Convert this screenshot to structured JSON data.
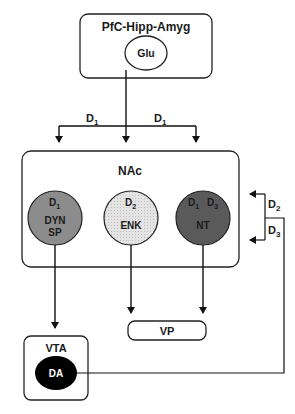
{
  "diagram": {
    "source_box": {
      "title": "PfC-Hipp-Amyg",
      "node": "Glu"
    },
    "top_receptors": {
      "left": "D",
      "left_sub": "1",
      "right": "D",
      "right_sub": "1"
    },
    "nac_box": {
      "title": "NAc",
      "neurons": [
        {
          "id": "dyn",
          "receptor_a": "D",
          "receptor_a_sub": "1",
          "line1": "DYN",
          "line2": "SP",
          "color": "#8a8a8a"
        },
        {
          "id": "enk",
          "receptor_a": "D",
          "receptor_a_sub": "2",
          "line1": "ENK",
          "line2": "",
          "color": "#dcdcdc"
        },
        {
          "id": "nt",
          "receptor_a": "D",
          "receptor_a_sub": "1",
          "receptor_b": "D",
          "receptor_b_sub": "3",
          "line1": "NT",
          "line2": "",
          "color": "#555555"
        }
      ]
    },
    "side_receptors": {
      "upper": "D",
      "upper_sub": "2",
      "lower": "D",
      "lower_sub": "3"
    },
    "vp_box": {
      "title": "VP"
    },
    "vta_box": {
      "title": "VTA",
      "node": "DA"
    }
  }
}
